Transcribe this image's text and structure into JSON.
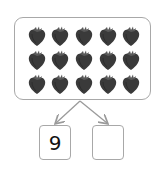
{
  "diagram": {
    "type": "number-bond",
    "total_group": {
      "item": "strawberry",
      "rows": 3,
      "columns": 5,
      "count": 15,
      "item_color": "#3a3a3a"
    },
    "parts": [
      {
        "label": "9"
      },
      {
        "label": ""
      }
    ],
    "border_color": "#a8a8a8",
    "arrow_color": "#9a9a9a"
  }
}
